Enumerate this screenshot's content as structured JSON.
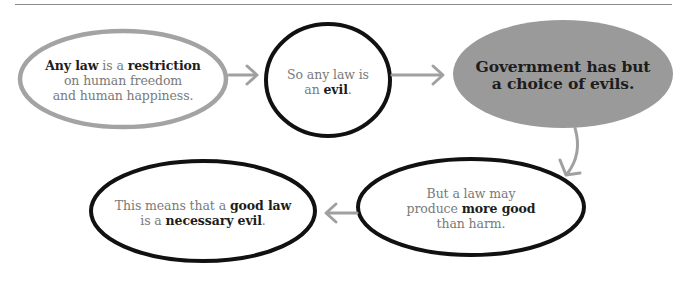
{
  "diagram": {
    "type": "flowchart",
    "colors": {
      "gray_outline": "#a3a3a3",
      "black_outline": "#111111",
      "gray_fill": "#9a9a9a",
      "arrow": "#a0a0a0",
      "text_light": "#7a7a7a",
      "text_bold": "#1d1d1d"
    },
    "nodes": [
      {
        "id": "n1",
        "style": "gray-outline",
        "lines": [
          [
            {
              "t": "Any law",
              "b": true
            },
            {
              "t": " is a ",
              "b": false
            },
            {
              "t": "restriction",
              "b": true
            }
          ],
          [
            {
              "t": "on human freedom",
              "b": false
            }
          ],
          [
            {
              "t": "and human happiness.",
              "b": false
            }
          ]
        ]
      },
      {
        "id": "n2",
        "style": "black-outline",
        "lines": [
          [
            {
              "t": "So any law is",
              "b": false
            }
          ],
          [
            {
              "t": "an ",
              "b": false
            },
            {
              "t": "evil",
              "b": true
            },
            {
              "t": ".",
              "b": false
            }
          ]
        ]
      },
      {
        "id": "n3",
        "style": "gray-filled",
        "lines": [
          [
            {
              "t": "Government has but",
              "b": true
            }
          ],
          [
            {
              "t": "a choice of evils.",
              "b": true
            }
          ]
        ]
      },
      {
        "id": "n4",
        "style": "black-outline",
        "lines": [
          [
            {
              "t": "But a law may",
              "b": false
            }
          ],
          [
            {
              "t": "produce ",
              "b": false
            },
            {
              "t": "more good",
              "b": true
            }
          ],
          [
            {
              "t": "than harm.",
              "b": false
            }
          ]
        ]
      },
      {
        "id": "n5",
        "style": "black-outline",
        "lines": [
          [
            {
              "t": "This means that a ",
              "b": false
            },
            {
              "t": "good law",
              "b": true
            }
          ],
          [
            {
              "t": "is a ",
              "b": false
            },
            {
              "t": "necessary evil",
              "b": true
            },
            {
              "t": ".",
              "b": false
            }
          ]
        ]
      }
    ],
    "edges": [
      {
        "from": "n1",
        "to": "n2",
        "direction": "right"
      },
      {
        "from": "n2",
        "to": "n3",
        "direction": "right"
      },
      {
        "from": "n3",
        "to": "n4",
        "direction": "down-curved"
      },
      {
        "from": "n4",
        "to": "n5",
        "direction": "left"
      }
    ]
  }
}
